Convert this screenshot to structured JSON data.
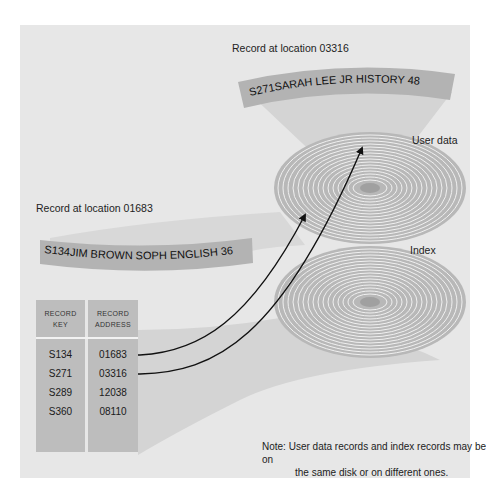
{
  "labels": {
    "top_record_location": "Record at location 03316",
    "left_record_location": "Record at location 01683",
    "user_data_disk": "User data",
    "index_disk": "Index"
  },
  "records": {
    "top": "S271SARAH LEE   JR   HISTORY 48",
    "left": "S134JIM BROWN   SOPH ENGLISH 36"
  },
  "index_table": {
    "headers": {
      "key": [
        "RECORD",
        "KEY"
      ],
      "address": [
        "RECORD",
        "ADDRESS"
      ]
    },
    "rows": [
      {
        "key": "S134",
        "address": "01683",
        "arrow_to": "user-data-disk"
      },
      {
        "key": "S271",
        "address": "03316",
        "arrow_to": "user-data-disk"
      },
      {
        "key": "S289",
        "address": "12038"
      },
      {
        "key": "S360",
        "address": "08110"
      }
    ]
  },
  "note": {
    "line1": "Note: User data records and index records may be on",
    "line2": "the same disk or on different ones."
  },
  "colors": {
    "panel": "#e7e7e7",
    "strip": "#b5b5b5",
    "funnel": "#d6d6d6",
    "disk_ring": "#a9a9a9",
    "arrow": "#111111"
  }
}
